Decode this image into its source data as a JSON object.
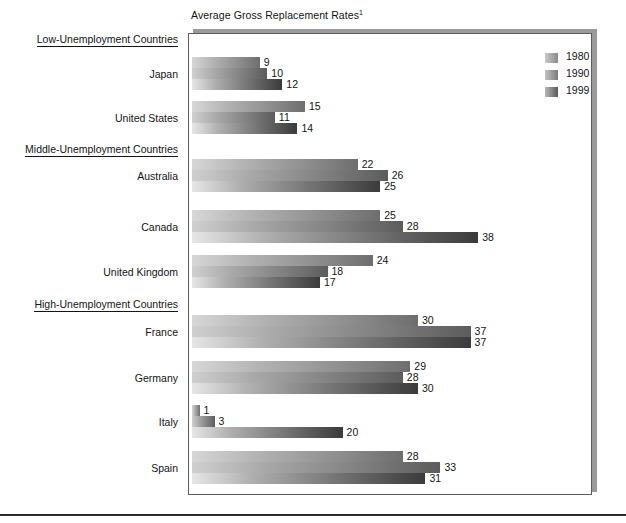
{
  "chart_data": {
    "type": "bar",
    "orientation": "horizontal",
    "title": "Average Gross Replacement Rates",
    "title_footnote_marker": "1",
    "xlabel": "",
    "ylabel": "",
    "xlim": [
      0,
      42
    ],
    "grid": false,
    "legend_position": "top-right",
    "series": [
      {
        "name": "1980",
        "values": [
          9,
          15,
          22,
          25,
          24,
          30,
          29,
          1,
          28
        ]
      },
      {
        "name": "1990",
        "values": [
          10,
          11,
          26,
          28,
          18,
          37,
          28,
          3,
          33
        ]
      },
      {
        "name": "1999",
        "values": [
          12,
          14,
          25,
          38,
          17,
          37,
          30,
          20,
          31
        ]
      }
    ],
    "categories": [
      "Japan",
      "United States",
      "Australia",
      "Canada",
      "United Kingdom",
      "France",
      "Germany",
      "Italy",
      "Spain"
    ],
    "groups": [
      {
        "heading": "Low-Unemployment Countries",
        "categories": [
          "Japan",
          "United States"
        ]
      },
      {
        "heading": "Middle-Unemployment Countries",
        "categories": [
          "Australia",
          "Canada",
          "United Kingdom"
        ]
      },
      {
        "heading": "High-Unemployment Countries",
        "categories": [
          "France",
          "Germany",
          "Italy",
          "Spain"
        ]
      }
    ],
    "rows": [
      {
        "group": "Low-Unemployment Countries",
        "label": "Japan",
        "values": [
          9,
          10,
          12
        ]
      },
      {
        "group": "Low-Unemployment Countries",
        "label": "United States",
        "values": [
          15,
          11,
          14
        ]
      },
      {
        "group": "Middle-Unemployment Countries",
        "label": "Australia",
        "values": [
          22,
          26,
          25
        ]
      },
      {
        "group": "Middle-Unemployment Countries",
        "label": "Canada",
        "values": [
          25,
          28,
          38
        ]
      },
      {
        "group": "Middle-Unemployment Countries",
        "label": "United Kingdom",
        "values": [
          24,
          18,
          17
        ]
      },
      {
        "group": "High-Unemployment Countries",
        "label": "France",
        "values": [
          30,
          37,
          37
        ]
      },
      {
        "group": "High-Unemployment Countries",
        "label": "Germany",
        "values": [
          29,
          28,
          30
        ]
      },
      {
        "group": "High-Unemployment Countries",
        "label": "Italy",
        "values": [
          1,
          3,
          20
        ]
      },
      {
        "group": "High-Unemployment Countries",
        "label": "Spain",
        "values": [
          28,
          33,
          31
        ]
      }
    ],
    "colors": {
      "series_1980_light": "#d7d7d7",
      "series_1980_dark": "#6e6e6e",
      "series_1990_light": "#cfcfcf",
      "series_1990_dark": "#5c5c5c",
      "series_1999_light": "#e6e6e6",
      "series_1999_dark": "#3b3b3b",
      "frame_border": "#5d5d5d",
      "text": "#141414",
      "background": "#ffffff"
    }
  },
  "legend": {
    "items": [
      {
        "label": "1980"
      },
      {
        "label": "1990"
      },
      {
        "label": "1999"
      }
    ]
  }
}
